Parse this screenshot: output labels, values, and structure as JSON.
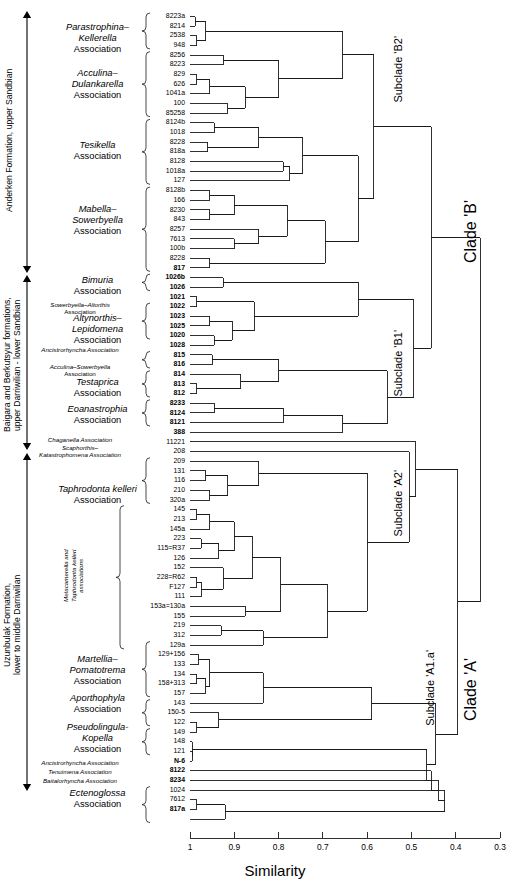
{
  "figure": {
    "type": "dendrogram",
    "axis_title": "Similarity",
    "axis_ticks": [
      "1",
      "0.9",
      "0.8",
      "0.7",
      "0.6",
      "0.5",
      "0.4",
      "0.3"
    ],
    "axis_min": 0.3,
    "axis_max": 1.0
  },
  "formations": [
    {
      "id": "anderken",
      "text": "Anderken Formation, upper Sandbian"
    },
    {
      "id": "baigara",
      "text": "Baigara and Berkutsyur formations,\nupper Darriwilian - lower Sandbian"
    },
    {
      "id": "uzunbulak",
      "text": "Uzunbulak Formation,\nlower to middle Darriwilian"
    }
  ],
  "clades": [
    {
      "id": "subclade-b2",
      "label": "Subclade 'B2'"
    },
    {
      "id": "subclade-b1",
      "label": "Subclade 'B1'"
    },
    {
      "id": "clade-b",
      "label": "Clade 'B'"
    },
    {
      "id": "subclade-a2",
      "label": "Subclade 'A2'"
    },
    {
      "id": "subclade-a1a",
      "label": "Subclade 'A1.a'"
    },
    {
      "id": "clade-a",
      "label": "Clade 'A'"
    }
  ],
  "associations": [
    {
      "id": "parastrophina-kellerella",
      "size": "big",
      "lines": [
        "Parastrophina–",
        "Kellerella",
        "Association"
      ],
      "italic": [
        true,
        true,
        false
      ]
    },
    {
      "id": "acculina-dulankarella",
      "size": "big",
      "lines": [
        "Acculina–",
        "Dulankarella",
        "Association"
      ],
      "italic": [
        true,
        true,
        false
      ]
    },
    {
      "id": "tesikella",
      "size": "big",
      "lines": [
        "Tesikella",
        "Association"
      ],
      "italic": [
        true,
        false
      ]
    },
    {
      "id": "mabella-sowerbyella",
      "size": "big",
      "lines": [
        "Mabella–",
        "Sowerbyella",
        "Association"
      ],
      "italic": [
        true,
        true,
        false
      ]
    },
    {
      "id": "bimuria",
      "size": "big",
      "lines": [
        "Bimuria",
        "Association"
      ],
      "italic": [
        true,
        false
      ]
    },
    {
      "id": "sowerbyella-altorthis",
      "size": "small",
      "lines": [
        "Sowerbyella–Altorthis",
        "Association"
      ],
      "italic": [
        true,
        false
      ]
    },
    {
      "id": "altynorthis-lepidomena",
      "size": "big",
      "lines": [
        "Altynorthis–",
        "Lepidomena",
        "Association"
      ],
      "italic": [
        true,
        true,
        false
      ]
    },
    {
      "id": "ancistrorhyncha-1",
      "size": "small",
      "lines": [
        "Ancistrorhyncha  Association"
      ],
      "italic": [
        true
      ]
    },
    {
      "id": "acculina-sowerbyella",
      "size": "small",
      "lines": [
        "Acculina–Sowerbyella",
        "Association"
      ],
      "italic": [
        true,
        false
      ]
    },
    {
      "id": "testaprica",
      "size": "big",
      "lines": [
        "Testaprica",
        "Association"
      ],
      "italic": [
        true,
        false
      ]
    },
    {
      "id": "eoanastrophia",
      "size": "big",
      "lines": [
        "Eoanastrophia",
        "Association"
      ],
      "italic": [
        true,
        false
      ]
    },
    {
      "id": "chaganella",
      "size": "small",
      "lines": [
        "Chaganella Association"
      ],
      "italic": [
        true
      ]
    },
    {
      "id": "scaphorthis-katastrophomena",
      "size": "small",
      "lines": [
        "Scaphorthis–",
        "Katastrophomena Association"
      ],
      "italic": [
        true,
        true
      ]
    },
    {
      "id": "taphrodonta-kelleri",
      "size": "big",
      "lines": [
        "Taphrodonta kelleri",
        "Association"
      ],
      "italic": [
        true,
        false
      ]
    },
    {
      "id": "metacamerella-taphrodonta",
      "size": "small",
      "vertical": true,
      "lines": [
        "Metacamerella and",
        "Taphrodonta kelleri",
        "associations"
      ],
      "italic": [
        true,
        true,
        true
      ]
    },
    {
      "id": "martellia-pomatotrema",
      "size": "big",
      "lines": [
        "Martellia–",
        "Pomatotrema",
        "Association"
      ],
      "italic": [
        true,
        true,
        false
      ]
    },
    {
      "id": "aporthophyla",
      "size": "big",
      "lines": [
        "Aporthophyla",
        "Association"
      ],
      "italic": [
        true,
        false
      ]
    },
    {
      "id": "pseudolingula-kopella",
      "size": "big",
      "lines": [
        "Pseudolingula-",
        "Kopella",
        "Association"
      ],
      "italic": [
        true,
        true,
        false
      ]
    },
    {
      "id": "ancistrorhyncha-2",
      "size": "small",
      "lines": [
        "Ancistrorhyncha  Association"
      ],
      "italic": [
        true
      ]
    },
    {
      "id": "tenuimena",
      "size": "small",
      "lines": [
        "Tenuimena  Association"
      ],
      "italic": [
        true
      ]
    },
    {
      "id": "baitalorhyncha",
      "size": "small",
      "lines": [
        "Baitalorhyncha Association"
      ],
      "italic": [
        true
      ]
    },
    {
      "id": "ectenoglossa",
      "size": "big",
      "lines": [
        "Ectenoglossa",
        "Association"
      ],
      "italic": [
        true,
        false
      ]
    }
  ],
  "leaves": [
    {
      "label": "8223a",
      "bold": false
    },
    {
      "label": "8214",
      "bold": false
    },
    {
      "label": "2538",
      "bold": false
    },
    {
      "label": "948",
      "bold": false
    },
    {
      "label": "8256",
      "bold": false
    },
    {
      "label": "8223",
      "bold": false
    },
    {
      "label": "829",
      "bold": false
    },
    {
      "label": "626",
      "bold": false
    },
    {
      "label": "1041a",
      "bold": false
    },
    {
      "label": "100",
      "bold": false
    },
    {
      "label": "85258",
      "bold": false
    },
    {
      "label": "8124b",
      "bold": false
    },
    {
      "label": "1018",
      "bold": false
    },
    {
      "label": "8228",
      "bold": false
    },
    {
      "label": "818a",
      "bold": false
    },
    {
      "label": "8128",
      "bold": false
    },
    {
      "label": "1018a",
      "bold": false
    },
    {
      "label": "127",
      "bold": false
    },
    {
      "label": "8128b",
      "bold": false
    },
    {
      "label": "166",
      "bold": false
    },
    {
      "label": "8230",
      "bold": false
    },
    {
      "label": "843",
      "bold": false
    },
    {
      "label": "8257",
      "bold": false
    },
    {
      "label": "7613",
      "bold": false
    },
    {
      "label": "100b",
      "bold": false
    },
    {
      "label": "8228",
      "bold": false
    },
    {
      "label": "817",
      "bold": true
    },
    {
      "label": "1026b",
      "bold": true
    },
    {
      "label": "1026",
      "bold": true
    },
    {
      "label": "1021",
      "bold": true
    },
    {
      "label": "1022",
      "bold": true
    },
    {
      "label": "1023",
      "bold": true
    },
    {
      "label": "1025",
      "bold": true
    },
    {
      "label": "1020",
      "bold": true
    },
    {
      "label": "1028",
      "bold": true
    },
    {
      "label": "815",
      "bold": true
    },
    {
      "label": "816",
      "bold": true
    },
    {
      "label": "814",
      "bold": true
    },
    {
      "label": "813",
      "bold": true
    },
    {
      "label": "812",
      "bold": true
    },
    {
      "label": "8233",
      "bold": true
    },
    {
      "label": "8124",
      "bold": true
    },
    {
      "label": "8121",
      "bold": true
    },
    {
      "label": "388",
      "bold": true
    },
    {
      "label": "11221",
      "bold": false
    },
    {
      "label": "208",
      "bold": false
    },
    {
      "label": "209",
      "bold": false
    },
    {
      "label": "131",
      "bold": false
    },
    {
      "label": "116",
      "bold": false
    },
    {
      "label": "210",
      "bold": false
    },
    {
      "label": "320a",
      "bold": false
    },
    {
      "label": "145",
      "bold": false
    },
    {
      "label": "213",
      "bold": false
    },
    {
      "label": "145a",
      "bold": false
    },
    {
      "label": "223",
      "bold": false
    },
    {
      "label": "115=R37",
      "bold": false
    },
    {
      "label": "126",
      "bold": false
    },
    {
      "label": "152",
      "bold": false
    },
    {
      "label": "228=R62",
      "bold": false
    },
    {
      "label": "F127",
      "bold": false
    },
    {
      "label": "111",
      "bold": false
    },
    {
      "label": "153a=130a",
      "bold": false
    },
    {
      "label": "155",
      "bold": false
    },
    {
      "label": "219",
      "bold": false
    },
    {
      "label": "312",
      "bold": false
    },
    {
      "label": "129a",
      "bold": false
    },
    {
      "label": "129+156",
      "bold": false
    },
    {
      "label": "133",
      "bold": false
    },
    {
      "label": "134",
      "bold": false
    },
    {
      "label": "158+313",
      "bold": false
    },
    {
      "label": "157",
      "bold": false
    },
    {
      "label": "143",
      "bold": false
    },
    {
      "label": "150-5",
      "bold": false
    },
    {
      "label": "122",
      "bold": false
    },
    {
      "label": "149",
      "bold": false
    },
    {
      "label": "148",
      "bold": false
    },
    {
      "label": "121",
      "bold": false
    },
    {
      "label": "N-6",
      "bold": true
    },
    {
      "label": "8122",
      "bold": true
    },
    {
      "label": "8234",
      "bold": true
    },
    {
      "label": "1024",
      "bold": false
    },
    {
      "label": "7612",
      "bold": false
    },
    {
      "label": "817a",
      "bold": true
    }
  ]
}
